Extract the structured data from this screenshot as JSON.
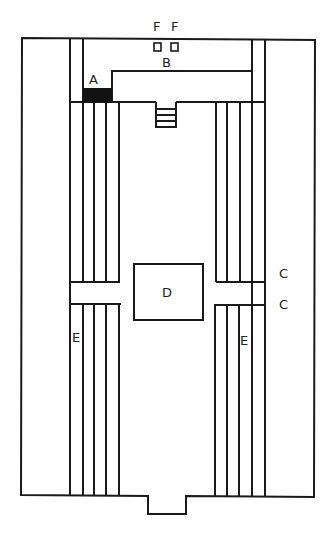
{
  "diagram": {
    "type": "floor-plan",
    "labels": {
      "A": "A",
      "B": "B",
      "C1": "C",
      "C2": "C",
      "D": "D",
      "E_left": "E",
      "E_right": "E",
      "F1": "F",
      "F2": "F"
    },
    "colors": {
      "line": "#1a1a1a",
      "fill_dark": "#111111",
      "background": "#ffffff"
    }
  }
}
